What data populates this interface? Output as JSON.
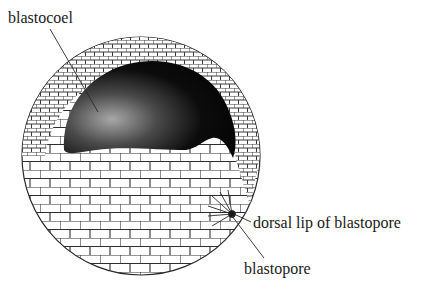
{
  "figure": {
    "labels": {
      "blastocoel": "blastocoel",
      "dorsal_lip": "dorsal lip of blastopore",
      "blastopore": "blastopore"
    }
  },
  "colors": {
    "background": "#ffffff",
    "outline": "#2a2a2a",
    "cavity_dark": "#0a0a0a",
    "cavity_light": "#9a9a9a",
    "cell_fill": "#ffffff",
    "text": "#1a1a1a"
  }
}
